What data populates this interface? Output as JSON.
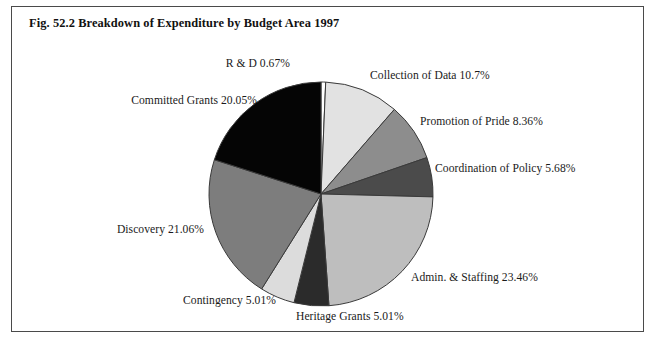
{
  "figure": {
    "title": "Fig. 52.2 Breakdown of Expenditure by Budget Area 1997"
  },
  "chart_data": {
    "type": "pie",
    "title": "Fig. 52.2 Breakdown of Expenditure by Budget Area 1997",
    "xlabel": "",
    "ylabel": "",
    "legend_position": "none",
    "labels_outside": true,
    "start_angle_deg": 0,
    "direction": "clockwise",
    "categories": [
      "R & D",
      "Collection of Data",
      "Promotion of Pride",
      "Coordination of Policy",
      "Admin. & Staffing",
      "Heritage Grants",
      "Contingency",
      "Discovery",
      "Committed Grants"
    ],
    "values": [
      0.67,
      10.7,
      8.36,
      5.68,
      23.46,
      5.01,
      5.01,
      21.06,
      20.05
    ],
    "value_unit": "%",
    "slices": [
      {
        "label": "R & D 0.67%",
        "name": "R & D",
        "value": 0.67,
        "color": "#ffffff"
      },
      {
        "label": "Collection of Data 10.7%",
        "name": "Collection of Data",
        "value": 10.7,
        "color": "#e2e2e2"
      },
      {
        "label": "Promotion of Pride 8.36%",
        "name": "Promotion of Pride",
        "value": 8.36,
        "color": "#8d8d8d"
      },
      {
        "label": "Coordination of Policy 5.68%",
        "name": "Coordination of Policy",
        "value": 5.68,
        "color": "#4b4b4b"
      },
      {
        "label": "Admin. & Staffing 23.46%",
        "name": "Admin. & Staffing",
        "value": 23.46,
        "color": "#bebebe"
      },
      {
        "label": "Heritage Grants 5.01%",
        "name": "Heritage Grants",
        "value": 5.01,
        "color": "#2b2b2b"
      },
      {
        "label": "Contingency 5.01%",
        "name": "Contingency",
        "value": 5.01,
        "color": "#dcdcdc"
      },
      {
        "label": "Discovery 21.06%",
        "name": "Discovery",
        "value": 21.06,
        "color": "#7d7d7d"
      },
      {
        "label": "Committed Grants 20.05%",
        "name": "Committed Grants",
        "value": 20.05,
        "color": "#050505"
      }
    ]
  },
  "colors": {
    "frame_border": "#4a4a4a",
    "slice_outline": "#3a3a3a",
    "text": "#1a1a1a",
    "background": "#ffffff"
  }
}
